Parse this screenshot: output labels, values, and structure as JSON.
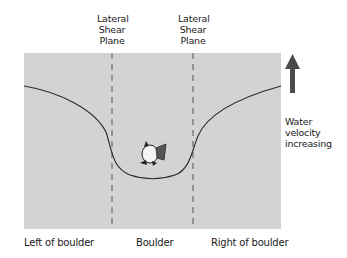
{
  "diagram": {
    "shear_plane_labels": [
      {
        "lines": [
          "Lateral",
          "Shear",
          "Plane"
        ]
      },
      {
        "lines": [
          "Lateral",
          "Shear",
          "Plane"
        ]
      }
    ],
    "arrow_label": [
      "Water",
      "velocity",
      "increasing"
    ],
    "regions": [
      "Left of boulder",
      "Boulder",
      "Right of boulder"
    ],
    "colors": {
      "background_panel": "#d3d3d3",
      "curve": "#2a2a2a",
      "dashed_line": "#555555",
      "arrow": "#4a4a4a"
    }
  }
}
